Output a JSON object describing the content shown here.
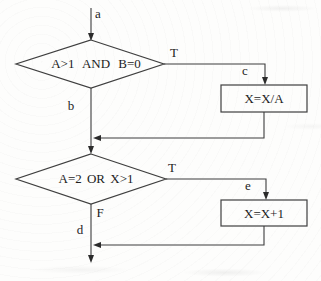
{
  "figure": {
    "background": "#fdfdfc",
    "line_color": "#3c3c3c",
    "text_color": "#1c1c1c"
  },
  "flowchart": {
    "entry": {
      "label": "a"
    },
    "decision1": {
      "condition": "A>1 AND B=0",
      "true_label": "T",
      "true_connector": "c",
      "false_connector": "b"
    },
    "process1": {
      "statement": "X=X/A"
    },
    "decision2": {
      "condition": "A=2 OR X>1",
      "true_label": "T",
      "false_label": "F",
      "true_connector": "e"
    },
    "process2": {
      "statement": "X=X+1"
    },
    "exit": {
      "label": "d"
    }
  }
}
